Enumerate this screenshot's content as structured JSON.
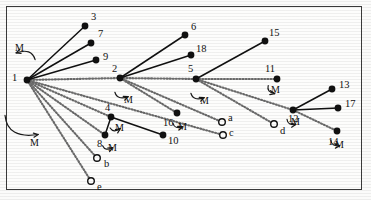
{
  "figure": {
    "type": "node-link-diagram",
    "border_color": "#3a3a3a",
    "node_color": "#111111",
    "solid_edge_color": "#111111",
    "dotted_edge_color": "#6b6b6b"
  },
  "nodes": [
    {
      "id": "1",
      "label": "1",
      "kind": "filled",
      "x": 27,
      "y": 80,
      "lx": 12,
      "ly": 73
    },
    {
      "id": "2",
      "label": "2",
      "kind": "filled",
      "x": 120,
      "y": 78,
      "lx": 112,
      "ly": 64
    },
    {
      "id": "5",
      "label": "5",
      "kind": "filled",
      "x": 196,
      "y": 79,
      "lx": 188,
      "ly": 64
    },
    {
      "id": "12",
      "label": "12",
      "kind": "filled",
      "x": 293,
      "y": 110,
      "lx": 288,
      "ly": 114
    },
    {
      "id": "3",
      "label": "3",
      "kind": "filled",
      "x": 85,
      "y": 26,
      "lx": 91,
      "ly": 12
    },
    {
      "id": "7",
      "label": "7",
      "kind": "filled",
      "x": 91,
      "y": 43,
      "lx": 98,
      "ly": 29
    },
    {
      "id": "9",
      "label": "9",
      "kind": "filled",
      "x": 96,
      "y": 60,
      "lx": 103,
      "ly": 52
    },
    {
      "id": "6",
      "label": "6",
      "kind": "filled",
      "x": 185,
      "y": 35,
      "lx": 191,
      "ly": 22
    },
    {
      "id": "18",
      "label": "18",
      "kind": "filled",
      "x": 191,
      "y": 55,
      "lx": 196,
      "ly": 44
    },
    {
      "id": "15",
      "label": "15",
      "kind": "filled",
      "x": 265,
      "y": 41,
      "lx": 269,
      "ly": 28
    },
    {
      "id": "11",
      "label": "11",
      "kind": "filled",
      "x": 277,
      "y": 79,
      "lx": 265,
      "ly": 64
    },
    {
      "id": "13",
      "label": "13",
      "kind": "filled",
      "x": 332,
      "y": 89,
      "lx": 339,
      "ly": 80
    },
    {
      "id": "17",
      "label": "17",
      "kind": "filled",
      "x": 338,
      "y": 108,
      "lx": 345,
      "ly": 99
    },
    {
      "id": "14",
      "label": "14",
      "kind": "filled",
      "x": 337,
      "y": 131,
      "lx": 328,
      "ly": 137
    },
    {
      "id": "4",
      "label": "4",
      "kind": "filled",
      "x": 111,
      "y": 117,
      "lx": 105,
      "ly": 103
    },
    {
      "id": "8",
      "label": "8",
      "kind": "filled",
      "x": 105,
      "y": 135,
      "lx": 97,
      "ly": 139
    },
    {
      "id": "10",
      "label": "10",
      "kind": "filled",
      "x": 163,
      "y": 135,
      "lx": 168,
      "ly": 136
    },
    {
      "id": "16",
      "label": "16",
      "kind": "filled",
      "x": 177,
      "y": 113,
      "lx": 163,
      "ly": 118
    },
    {
      "id": "a",
      "label": "a",
      "kind": "open",
      "x": 222,
      "y": 122,
      "lx": 228,
      "ly": 113
    },
    {
      "id": "c",
      "label": "c",
      "kind": "open",
      "x": 223,
      "y": 135,
      "lx": 229,
      "ly": 128
    },
    {
      "id": "d",
      "label": "d",
      "kind": "open",
      "x": 274,
      "y": 124,
      "lx": 280,
      "ly": 126
    },
    {
      "id": "b",
      "label": "b",
      "kind": "open",
      "x": 97,
      "y": 158,
      "lx": 104,
      "ly": 159
    },
    {
      "id": "e",
      "label": "e",
      "kind": "open",
      "x": 91,
      "y": 181,
      "lx": 97,
      "ly": 182
    }
  ],
  "edges_solid": [
    {
      "from": "1",
      "to": "3"
    },
    {
      "from": "1",
      "to": "7"
    },
    {
      "from": "1",
      "to": "9"
    },
    {
      "from": "2",
      "to": "6"
    },
    {
      "from": "2",
      "to": "18"
    },
    {
      "from": "5",
      "to": "15"
    },
    {
      "from": "12",
      "to": "13"
    },
    {
      "from": "12",
      "to": "17"
    },
    {
      "from": "4",
      "to": "10"
    },
    {
      "from": "4",
      "to": "8"
    }
  ],
  "edges_dotted": [
    {
      "from": "1",
      "to": "2"
    },
    {
      "from": "2",
      "to": "5"
    },
    {
      "from": "5",
      "to": "11"
    },
    {
      "from": "5",
      "to": "12"
    },
    {
      "from": "12",
      "to": "14"
    },
    {
      "from": "2",
      "to": "16"
    },
    {
      "from": "2",
      "to": "a"
    },
    {
      "from": "5",
      "to": "d"
    },
    {
      "from": "1",
      "to": "4"
    },
    {
      "from": "1",
      "to": "8"
    },
    {
      "from": "1",
      "to": "b"
    },
    {
      "from": "1",
      "to": "e"
    },
    {
      "from": "1",
      "to": "c"
    }
  ],
  "arc_markers": [
    {
      "label": "M",
      "cx": 27,
      "cy": 80,
      "lx": 33,
      "ly": 143,
      "note": "branch-1-lower"
    },
    {
      "label": "M",
      "cx": 27,
      "cy": 80,
      "lx": 18,
      "ly": 48,
      "note": "branch-1-upper"
    },
    {
      "label": "M",
      "cx": 120,
      "cy": 78,
      "lx": 127,
      "ly": 100,
      "note": "branch-2"
    },
    {
      "label": "M",
      "cx": 196,
      "cy": 79,
      "lx": 203,
      "ly": 101,
      "note": "branch-5"
    },
    {
      "label": "M",
      "cx": 277,
      "cy": 79,
      "lx": 274,
      "ly": 90,
      "note": "node-11"
    },
    {
      "label": "M",
      "cx": 293,
      "cy": 110,
      "lx": 294,
      "ly": 122,
      "note": "branch-12"
    },
    {
      "label": "M",
      "cx": 337,
      "cy": 131,
      "lx": 338,
      "ly": 145,
      "note": "node-14"
    },
    {
      "label": "M",
      "cx": 111,
      "cy": 117,
      "lx": 118,
      "ly": 128,
      "note": "node-4"
    },
    {
      "label": "M",
      "cx": 105,
      "cy": 135,
      "lx": 111,
      "ly": 148,
      "note": "node-8"
    },
    {
      "label": "M",
      "cx": 177,
      "cy": 113,
      "lx": 181,
      "ly": 127,
      "note": "node-16"
    }
  ],
  "arc_labels_text": "M"
}
